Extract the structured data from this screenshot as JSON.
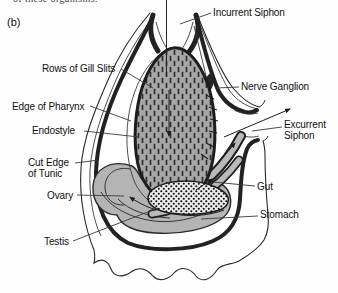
{
  "figure": {
    "caption_fragment": "of these organisms.",
    "panel_label": "(b)"
  },
  "labels": {
    "incurrent_siphon": "Incurrent Siphon",
    "rows_of_gill_slits": "Rows of Gill Slits",
    "nerve_ganglion": "Nerve Ganglion",
    "edge_of_pharynx": "Edge of Pharynx",
    "endostyle": "Endostyle",
    "excurrent_siphon": "Excurrent Siphon",
    "cut_edge_of_tunic": "Cut Edge of Tunic",
    "ovary": "Ovary",
    "gut": "Gut",
    "stomach": "Stomach",
    "testis": "Testis"
  },
  "colors": {
    "background": "#fefefe",
    "line_art": "#1d1d1d",
    "pharynx_gray": "#a6a6a6",
    "organ_gray": "#b4b4b4",
    "stipple_bg": "#ececec",
    "label_text": "#0e0e0e"
  }
}
